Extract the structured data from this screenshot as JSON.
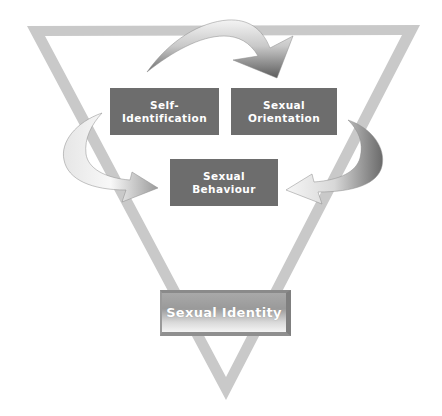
{
  "diagram": {
    "type": "inverted-triangle-cycle",
    "boxes": [
      {
        "id": "self-identification",
        "line1": "Self-",
        "line2": "Identification"
      },
      {
        "id": "sexual-orientation",
        "line1": "Sexual",
        "line2": "Orientation"
      },
      {
        "id": "sexual-behaviour",
        "line1": "Sexual",
        "line2": "Behaviour"
      }
    ],
    "result": {
      "label": "Sexual Identity"
    },
    "arrows": [
      {
        "from": "self-identification",
        "to": "sexual-orientation",
        "position": "top"
      },
      {
        "from": "sexual-orientation",
        "to": "sexual-behaviour",
        "position": "right"
      },
      {
        "from": "self-identification",
        "to": "sexual-behaviour",
        "position": "left"
      }
    ],
    "colors": {
      "box_fill": "#6d6d6d",
      "box_text": "#ffffff",
      "triangle": "#c8c8c8",
      "arrow_light": "#f2f2f2",
      "arrow_dark": "#5a5a5a"
    }
  }
}
